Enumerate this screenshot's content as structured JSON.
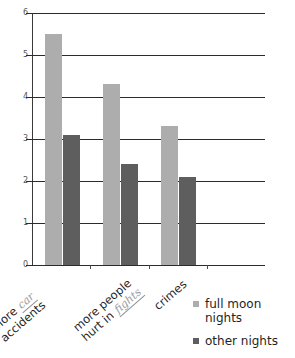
{
  "chart_data": {
    "type": "bar",
    "title": "",
    "xlabel": "",
    "ylabel": "",
    "ylim": [
      0,
      6
    ],
    "yticks": [
      "0",
      "1",
      "2",
      "3",
      "4",
      "5",
      "6"
    ],
    "grid": true,
    "legend_position": "bottom-right",
    "categories": [
      "more car accidents",
      "more people hurt in fights",
      "crimes"
    ],
    "series": [
      {
        "name": "full moon nights",
        "color": "#adadad",
        "values": [
          5.5,
          4.3,
          3.3
        ]
      },
      {
        "name": "other nights",
        "color": "#5e5e5e",
        "values": [
          3.1,
          2.4,
          2.1
        ]
      }
    ]
  },
  "axis": {
    "y_ticks": [
      {
        "label": "6",
        "value": 6
      },
      {
        "label": "5",
        "value": 5
      },
      {
        "label": "4",
        "value": 4
      },
      {
        "label": "3",
        "value": 3
      },
      {
        "label": "2",
        "value": 2
      },
      {
        "label": "1",
        "value": 1
      },
      {
        "label": "0",
        "value": 0
      }
    ]
  },
  "category_labels": [
    {
      "line1_pre": "more ",
      "line1_hand": "car",
      "line1_post": "",
      "line2": "accidents"
    },
    {
      "line1_pre": "more people",
      "line1_hand": "",
      "line1_post": "",
      "line2_pre": "hurt in ",
      "line2_hand": "fights",
      "line2_post": ""
    },
    {
      "line1_pre": "crimes",
      "line1_hand": "",
      "line1_post": "",
      "line2": ""
    }
  ],
  "legend": {
    "items": [
      {
        "label": "full moon nights",
        "color": "#adadad"
      },
      {
        "label": "other nights",
        "color": "#5e5e5e"
      }
    ]
  }
}
